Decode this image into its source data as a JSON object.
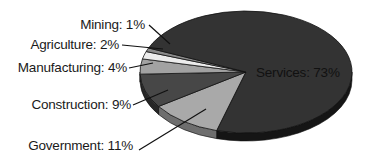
{
  "chart_data": {
    "type": "pie",
    "style": "3d-exploded-none",
    "title": "",
    "categories": [
      "Services",
      "Government",
      "Construction",
      "Manufacturing",
      "Agriculture",
      "Mining"
    ],
    "values": [
      73,
      11,
      9,
      4,
      2,
      1
    ],
    "unit": "%",
    "labels": [
      {
        "name": "Services",
        "text": "Services: 73%",
        "placement": "inside"
      },
      {
        "name": "Government",
        "text": "Government: 11%",
        "placement": "outside-left"
      },
      {
        "name": "Construction",
        "text": "Construction: 9%",
        "placement": "outside-left"
      },
      {
        "name": "Manufacturing",
        "text": "Manufacturing: 4%",
        "placement": "outside-left"
      },
      {
        "name": "Agriculture",
        "text": "Agriculture: 2%",
        "placement": "outside-left"
      },
      {
        "name": "Mining",
        "text": "Mining: 1%",
        "placement": "outside-left"
      }
    ],
    "colors": {
      "Services": "#333333",
      "Government": "#a9a9a9",
      "Construction": "#474747",
      "Manufacturing": "#a2a2a2",
      "Agriculture": "#ececec",
      "Mining": "#8a8a8a"
    },
    "side_colors": {
      "Services": "#151515",
      "Government": "#6e6e6e",
      "Construction": "#262626",
      "Manufacturing": "#666666",
      "Agriculture": "#bbbbbb",
      "Mining": "#555555"
    },
    "legend": "none",
    "grid": false
  },
  "geometry": {
    "cx": 246,
    "cy": 72,
    "rx": 106,
    "ry": 61,
    "depth": 8,
    "start_angle_deg": 106,
    "order_clockwise_from_start": [
      "Government",
      "Construction",
      "Manufacturing",
      "Agriculture",
      "Mining",
      "Services"
    ]
  },
  "label_positions": {
    "Services": {
      "x": 256,
      "y": 77,
      "anchor": "start"
    },
    "Mining": {
      "x": 145,
      "y": 29,
      "anchor": "end",
      "line": [
        149,
        25,
        170,
        44
      ]
    },
    "Agriculture": {
      "x": 119,
      "y": 49,
      "anchor": "end",
      "line": [
        122,
        45,
        163,
        49
      ]
    },
    "Manufacturing": {
      "x": 127,
      "y": 72,
      "anchor": "end",
      "line": [
        129,
        68,
        153,
        63
      ]
    },
    "Construction": {
      "x": 131,
      "y": 109,
      "anchor": "end",
      "line": [
        133,
        105,
        168,
        90
      ]
    },
    "Government": {
      "x": 133,
      "y": 150,
      "anchor": "end",
      "line": [
        139,
        150,
        206,
        109
      ]
    }
  }
}
